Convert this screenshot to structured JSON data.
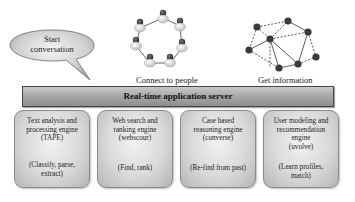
{
  "diagram": {
    "speech_bubble": {
      "label_line1": "Start",
      "label_line2": "conversation"
    },
    "people_network": {
      "caption": "Connect to people",
      "node_count": 7
    },
    "info_network": {
      "caption": "Get information",
      "node_count": 9
    },
    "server": {
      "label": "Real-time application server"
    },
    "engines": [
      {
        "line1": "Text analysis and",
        "line2": "processing engine",
        "line3": "(TAPE)",
        "line4": "",
        "func1": "(Classify, parse,",
        "func2": "extract)"
      },
      {
        "line1": "Web search and",
        "line2": "ranking engine",
        "line3": "(webscour)",
        "line4": "",
        "func1": "(Find, rank)",
        "func2": ""
      },
      {
        "line1": "Case based",
        "line2": "reasoning engine",
        "line3": "(converse)",
        "line4": "",
        "func1": "(Re-find from past)",
        "func2": ""
      },
      {
        "line1": "User modeling and",
        "line2": "recommendation",
        "line3": "engine",
        "line4": "(uvolve)",
        "func1": "(Learn profiles,",
        "func2": "match)"
      }
    ],
    "colors": {
      "box_fill": "#d9d9d9",
      "server_fill": "#a9a9a9",
      "node_dark": "#3a3a3a",
      "node_light": "#e8e8e8"
    }
  }
}
